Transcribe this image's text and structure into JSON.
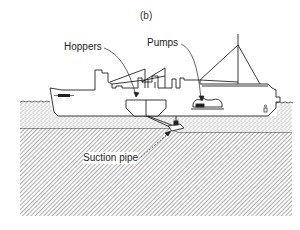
{
  "figure": {
    "caption": "(b)",
    "labels": {
      "hoppers": "Hoppers",
      "pumps": "Pumps",
      "suction_pipe": "Suction pipe"
    },
    "colors": {
      "ink": "#222222",
      "background": "#ffffff",
      "hatch": "#555555",
      "stipple": "#888888"
    }
  }
}
